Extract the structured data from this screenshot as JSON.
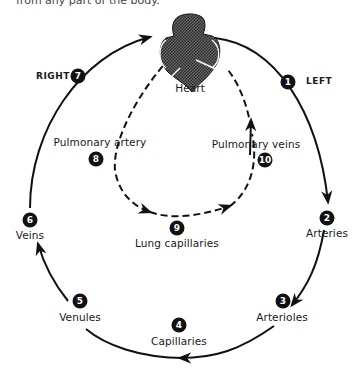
{
  "caption": "from any part of the body.",
  "diagram": {
    "center_label": "Heart",
    "sides": {
      "left": "LEFT",
      "right": "RIGHT"
    },
    "colors": {
      "line": "#111111",
      "badge": "#111111",
      "heart": "#4a4a4a"
    },
    "systemic_circuit": [
      {
        "number": "1",
        "label": ""
      },
      {
        "number": "2",
        "label": "Arteries"
      },
      {
        "number": "3",
        "label": "Arterioles"
      },
      {
        "number": "4",
        "label": "Capillaries"
      },
      {
        "number": "5",
        "label": "Venules"
      },
      {
        "number": "6",
        "label": "Veins"
      },
      {
        "number": "7",
        "label": ""
      }
    ],
    "pulmonary_circuit": [
      {
        "number": "8",
        "label": "Pulmonary artery"
      },
      {
        "number": "9",
        "label": "Lung capillaries"
      },
      {
        "number": "10",
        "label": "Pulmonary veins"
      }
    ]
  }
}
